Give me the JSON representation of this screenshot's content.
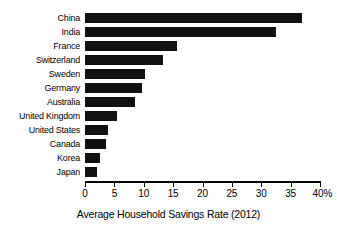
{
  "chart_data": {
    "type": "bar",
    "orientation": "horizontal",
    "title": "",
    "xlabel": "Average Household Savings Rate (2012)",
    "ylabel": "",
    "categories": [
      "China",
      "India",
      "France",
      "Switzerland",
      "Sweden",
      "Germany",
      "Australia",
      "United Kingdom",
      "United States",
      "Canada",
      "Korea",
      "Japan"
    ],
    "values": [
      37,
      32.5,
      15.7,
      13.3,
      10.2,
      9.7,
      8.5,
      5.4,
      3.9,
      3.6,
      2.6,
      2.0
    ],
    "xlim": [
      0,
      40
    ],
    "xticks": [
      0,
      5,
      10,
      15,
      20,
      25,
      30,
      35,
      40
    ],
    "xtick_labels": [
      "0",
      "5",
      "10",
      "15",
      "20",
      "25",
      "30",
      "35",
      "40%"
    ],
    "unit": "%",
    "grid": false,
    "legend": null,
    "bar_color": "#111111",
    "background_color": "#ffffff",
    "axis_color": "#000000"
  },
  "axis": {
    "title": "Average Household Savings Rate (2012)"
  }
}
